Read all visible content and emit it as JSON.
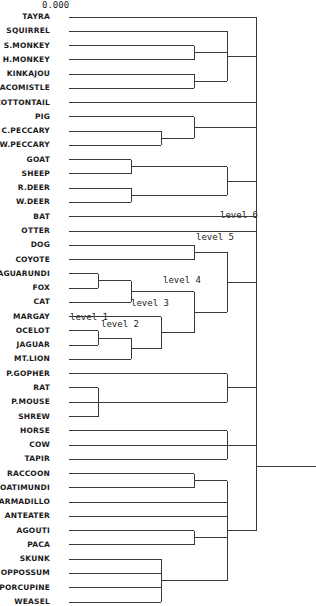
{
  "chart_data": {
    "type": "dendrogram",
    "title": "",
    "scale_label": "0.000",
    "orientation": "leaves-left, root-right",
    "leaves": [
      "TAYRA",
      "SQUIRREL",
      "S.MONKEY",
      "H.MONKEY",
      "KINKAJOU",
      "CACOMISTLE",
      "COTTONTAIL",
      "PIG",
      "C.PECCARY",
      "W.PECCARY",
      "GOAT",
      "SHEEP",
      "R.DEER",
      "W.DEER",
      "BAT",
      "OTTER",
      "DOG",
      "COYOTE",
      "JAGUARUNDI",
      "FOX",
      "CAT",
      "MARGAY",
      "OCELOT",
      "JAGUAR",
      "MT.LION",
      "P.GOPHER",
      "RAT",
      "P.MOUSE",
      "SHREW",
      "HORSE",
      "COW",
      "TAPIR",
      "RACCOON",
      "COATIMUNDI",
      "ARMADILLO",
      "ANTEATER",
      "AGOUTI",
      "PACA",
      "SKUNK",
      "OPPOSSUM",
      "PORCUPINE",
      "WEASEL"
    ],
    "levels": {
      "leaf_x": 69,
      "L1": 98,
      "L2": 131,
      "L3": 161,
      "L4": 194,
      "L5": 227,
      "L6": 256
    },
    "level_annotations": [
      {
        "text": "level 1",
        "x": 70,
        "y": 320
      },
      {
        "text": "level 2",
        "x": 101,
        "y": 327
      },
      {
        "text": "level 3",
        "x": 131,
        "y": 306
      },
      {
        "text": "level 4",
        "x": 163,
        "y": 283
      },
      {
        "text": "level 5",
        "x": 196,
        "y": 240
      },
      {
        "text": "level 6",
        "x": 220,
        "y": 218
      }
    ],
    "merges": [
      {
        "children": [
          "S.MONKEY",
          "H.MONKEY"
        ],
        "level": "L4"
      },
      {
        "children": [
          "KINKAJOU",
          "CACOMISTLE"
        ],
        "level": "L4"
      },
      {
        "children": [
          "SQUIRREL",
          "(S.MONKEY,H.MONKEY)",
          "(KINKAJOU,CACOMISTLE)"
        ],
        "level": "L5"
      },
      {
        "children": [
          "C.PECCARY",
          "W.PECCARY"
        ],
        "level": "L3"
      },
      {
        "children": [
          "PIG",
          "(C.PECCARY,W.PECCARY)"
        ],
        "level": "L4"
      },
      {
        "children": [
          "GOAT",
          "SHEEP"
        ],
        "level": "L2"
      },
      {
        "children": [
          "R.DEER",
          "W.DEER"
        ],
        "level": "L2"
      },
      {
        "children": [
          "(GOAT,SHEEP)",
          "(R.DEER,W.DEER)"
        ],
        "level": "L5"
      },
      {
        "children": [
          "DOG",
          "COYOTE"
        ],
        "level": "L4"
      },
      {
        "children": [
          "JAGUARUNDI",
          "FOX"
        ],
        "level": "L1"
      },
      {
        "children": [
          "(JAGUARUNDI,FOX)",
          "CAT"
        ],
        "level": "L2"
      },
      {
        "children": [
          "OCELOT",
          "JAGUAR"
        ],
        "level": "L1"
      },
      {
        "children": [
          "(OCELOT,JAGUAR)",
          "MT.LION"
        ],
        "level": "L2"
      },
      {
        "children": [
          "MARGAY",
          "((OCELOT,JAGUAR),MT.LION)"
        ],
        "level": "L3"
      },
      {
        "children": [
          "((JAGUARUNDI,FOX),CAT)",
          "(MARGAY,...)"
        ],
        "level": "L4"
      },
      {
        "children": [
          "(DOG,COYOTE)",
          "felid-cluster"
        ],
        "level": "L5"
      },
      {
        "children": [
          "RAT",
          "P.MOUSE",
          "SHREW"
        ],
        "level": "L1"
      },
      {
        "children": [
          "P.GOPHER",
          "(RAT,P.MOUSE,SHREW)"
        ],
        "level": "L5"
      },
      {
        "children": [
          "HORSE",
          "COW",
          "TAPIR"
        ],
        "level": "L5"
      },
      {
        "children": [
          "RACCOON",
          "COATIMUNDI"
        ],
        "level": "L4"
      },
      {
        "children": [
          "AGOUTI",
          "PACA"
        ],
        "level": "L4"
      },
      {
        "children": [
          "SKUNK",
          "OPPOSSUM",
          "PORCUPINE",
          "WEASEL"
        ],
        "level": "L3"
      },
      {
        "children": [
          "(RACCOON,COATIMUNDI)",
          "ARMADILLO",
          "ANTEATER",
          "(AGOUTI,PACA)",
          "(SKUNK,...)"
        ],
        "level": "L5"
      },
      {
        "children": [
          "TAYRA",
          "squirrel-cluster",
          "COTTONTAIL",
          "pig-cluster",
          "ruminant-cluster",
          "BAT",
          "OTTER",
          "canid-felid-cluster",
          "rodent-cluster",
          "ungulate-cluster",
          "raccoon-cluster"
        ],
        "level": "L6"
      }
    ]
  },
  "diagram": {
    "scale_label": "0.000"
  }
}
